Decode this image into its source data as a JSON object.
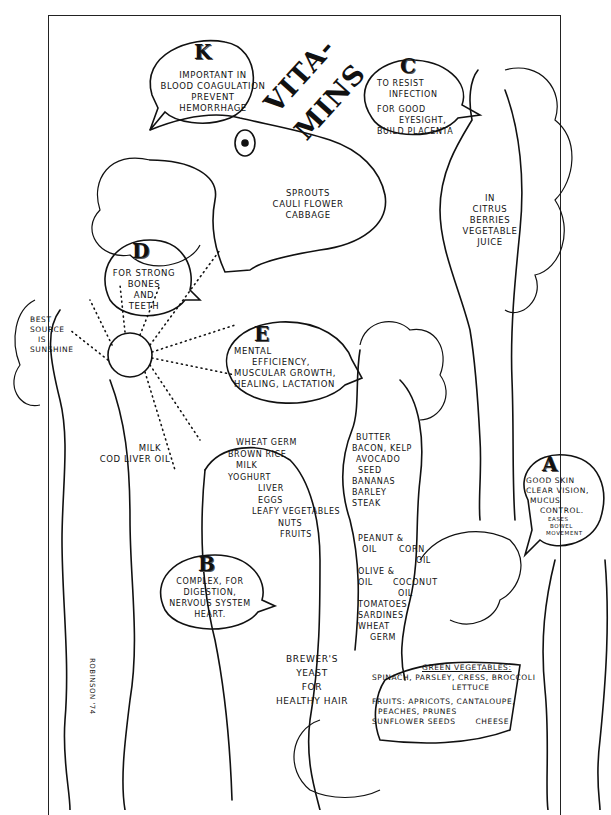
{
  "title": {
    "line1": "VITA-",
    "line2": "MINS"
  },
  "vitamins": [
    {
      "letter": "K",
      "benefits": [
        "IMPORTANT IN",
        "BLOOD COAGULATION",
        "PREVENT",
        "HEMORRHAGE"
      ],
      "sources": [
        "SPROUTS",
        "CAULI FLOWER",
        "CABBAGE"
      ]
    },
    {
      "letter": "C",
      "benefits": [
        "TO RESIST",
        "INFECTION",
        "FOR GOOD",
        "EYESIGHT,",
        "BUILD PLACENTA"
      ],
      "sources": [
        "IN",
        "CITRUS",
        "BERRIES",
        "VEGETABLE",
        "JUICE"
      ]
    },
    {
      "letter": "D",
      "benefits": [
        "FOR STRONG",
        "BONES",
        "AND",
        "TEETH"
      ],
      "note": [
        "BEST",
        "SOURCE",
        "IS",
        "SUNSHINE"
      ],
      "sources": [
        "MILK",
        "COD LIVER OIL"
      ]
    },
    {
      "letter": "E",
      "benefits": [
        "MENTAL",
        "EFFICIENCY,",
        "MUSCULAR GROWTH,",
        "HEALING, LACTATION"
      ],
      "sources": [
        "BUTTER",
        "BACON, KELP",
        "AVOCADO",
        "SEED",
        "BANANAS",
        "BARLEY",
        "STEAK",
        "PEANUT &",
        "OIL",
        "CORN",
        "OIL",
        "OLIVE &",
        "OIL",
        "COCONUT",
        "OIL",
        "TOMATOES",
        "SARDINES",
        "WHEAT",
        "GERM"
      ]
    },
    {
      "letter": "B",
      "benefits": [
        "COMPLEX, FOR",
        "DIGESTION,",
        "NERVOUS SYSTEM",
        "HEART."
      ],
      "sources": [
        "WHEAT GERM",
        "BROWN RICE",
        "MILK",
        "YOGHURT",
        "LIVER",
        "EGGS",
        "LEAFY VEGETABLES",
        "NUTS",
        "FRUITS"
      ],
      "extra": [
        "BREWER'S",
        "YEAST",
        "FOR",
        "HEALTHY HAIR"
      ]
    },
    {
      "letter": "A",
      "benefits": [
        "GOOD SKIN",
        "CLEAR VISION,",
        "MUCUS",
        "CONTROL.",
        "EASES",
        "BOWEL",
        "MOVEMENT"
      ],
      "sources": {
        "heading": "GREEN VEGETABLES:",
        "veg1": "SPINACH, PARSLEY, CRESS, BROCCOLI",
        "veg2": "LETTUCE",
        "fruits1": "FRUITS: APRICOTS, CANTALOUPE,",
        "fruits2": "PEACHES, PRUNES",
        "fruits3": "SUNFLOWER SEEDS",
        "cheese": "CHEESE"
      }
    }
  ],
  "signature": "ROBINSON '74"
}
